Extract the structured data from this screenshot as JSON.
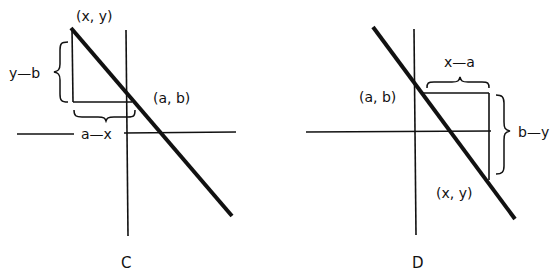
{
  "diagram": {
    "colors": {
      "ink": "#111111",
      "background": "#ffffff"
    },
    "panels": [
      {
        "id": "C",
        "caption": "C",
        "labels": {
          "point_xy": "(x, y)",
          "point_ab": "(a, b)",
          "vertical_diff": "y—b",
          "horizontal_diff": "a—x"
        }
      },
      {
        "id": "D",
        "caption": "D",
        "labels": {
          "point_ab": "(a, b)",
          "point_xy": "(x, y)",
          "horizontal_diff": "x—a",
          "vertical_diff": "b—y"
        }
      }
    ]
  }
}
